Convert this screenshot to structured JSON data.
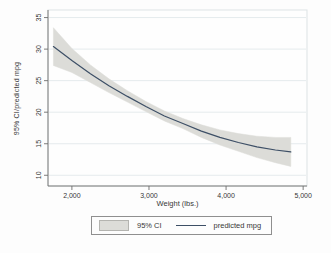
{
  "figure": {
    "page_bg": "#fdfdfd",
    "plot_bg": "#fefefe",
    "plot_border": "#dde3e5",
    "grid_color": "#e5ebed",
    "axis_color": "#6e6e6e",
    "text_color": "#383838",
    "band_color": "#dcdcd8",
    "line_color": "#3d4f66"
  },
  "legend": {
    "ci_label": "95% CI",
    "line_label": "predicted mpg"
  },
  "chart_data": {
    "type": "area",
    "title": "",
    "xlabel": "Weight (lbs.)",
    "ylabel": "95% CI/predicted mpg",
    "legend_position": "bottom",
    "grid": "horizontal",
    "xlim": [
      1690,
      5050
    ],
    "ylim": [
      8.3,
      36.2
    ],
    "x_ticks": [
      2000,
      3000,
      4000,
      5000
    ],
    "x_tick_labels": [
      "2,000",
      "3,000",
      "4,000",
      "5,000"
    ],
    "y_ticks": [
      10,
      15,
      20,
      25,
      30,
      35
    ],
    "y_tick_labels": [
      "10",
      "15",
      "20",
      "25",
      "30",
      "35"
    ],
    "x": [
      1760,
      2000,
      2240,
      2480,
      2720,
      2960,
      3200,
      3440,
      3680,
      3920,
      4160,
      4400,
      4640,
      4840
    ],
    "series": [
      {
        "name": "95% CI",
        "type": "band",
        "upper": [
          33.4,
          30.1,
          27.5,
          25.3,
          23.4,
          21.7,
          20.2,
          19.0,
          18.0,
          17.2,
          16.6,
          16.2,
          16.0,
          16.0
        ],
        "lower": [
          27.4,
          26.3,
          24.7,
          23.1,
          21.6,
          20.1,
          18.6,
          17.4,
          16.0,
          14.8,
          13.8,
          12.8,
          12.0,
          11.4
        ]
      },
      {
        "name": "predicted mpg",
        "type": "line",
        "values": [
          30.4,
          28.2,
          26.1,
          24.2,
          22.5,
          20.9,
          19.4,
          18.2,
          17.0,
          16.0,
          15.2,
          14.5,
          14.0,
          13.7
        ]
      }
    ]
  }
}
